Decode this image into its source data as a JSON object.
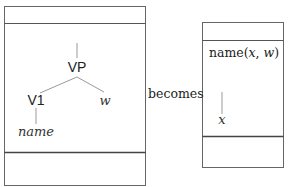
{
  "left_box": {
    "tree": {
      "root": "VP",
      "left_child": "V1",
      "right_child": "w",
      "leaf": "name"
    }
  },
  "connector": {
    "label": "becomes"
  },
  "right_box": {
    "condition": "name(x, w)",
    "condition_parts": {
      "pred": "name(",
      "arg1": "x",
      "sep": ", ",
      "arg2": "w",
      "close": ")"
    },
    "tree": {
      "node": "x"
    }
  },
  "colors": {
    "line": "#555555",
    "text": "#222222"
  }
}
